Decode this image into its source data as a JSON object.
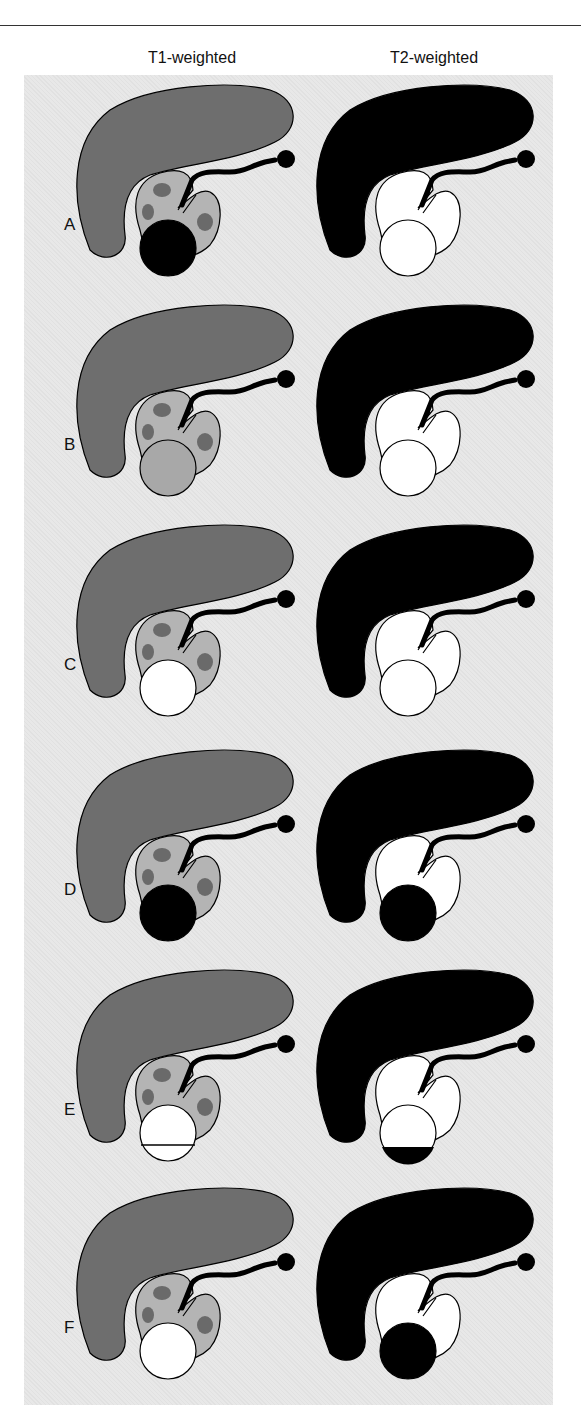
{
  "headers": {
    "t1": "T1-weighted",
    "t2": "T2-weighted"
  },
  "colors": {
    "panel_bg": "#e8e8e8",
    "t1_liver": "#6e6e6e",
    "t1_kidney": "#b4b4b4",
    "t1_medulla": "#6a6a6a",
    "t2_liver": "#000000",
    "t2_kidney": "#ffffff",
    "black": "#000000",
    "white": "#ffffff",
    "intermediate": "#a8a8a8"
  },
  "rows": [
    {
      "label": "A",
      "t1_lesion": "black",
      "t2_lesion": "white",
      "t1_level": null,
      "t2_level": null
    },
    {
      "label": "B",
      "t1_lesion": "intermediate",
      "t2_lesion": "white",
      "t1_level": null,
      "t2_level": null
    },
    {
      "label": "C",
      "t1_lesion": "white",
      "t2_lesion": "white",
      "t1_level": null,
      "t2_level": null
    },
    {
      "label": "D",
      "t1_lesion": "black",
      "t2_lesion": "black",
      "t1_level": null,
      "t2_level": null
    },
    {
      "label": "E",
      "t1_lesion": "white",
      "t2_lesion": "white",
      "t1_level": "line",
      "t2_level": "black"
    },
    {
      "label": "F",
      "t1_lesion": "white",
      "t2_lesion": "black",
      "t1_level": null,
      "t2_level": null
    }
  ]
}
